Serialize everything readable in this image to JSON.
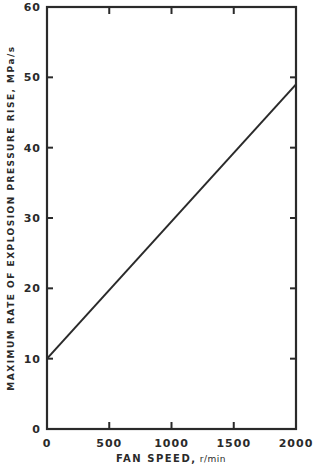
{
  "chart_data": {
    "type": "line",
    "title": "",
    "xlabel": "FAN SPEED, r/min",
    "ylabel": "MAXIMUM RATE OF EXPLOSION PRESSURE RISE, MPa/s",
    "xlim": [
      0,
      2000
    ],
    "ylim": [
      0,
      60
    ],
    "xticks": [
      0,
      500,
      1000,
      1500,
      2000
    ],
    "yticks": [
      0,
      10,
      20,
      30,
      40,
      50,
      60
    ],
    "grid": false,
    "legend": null,
    "series": [
      {
        "name": "Max rate of pressure rise",
        "x": [
          0,
          2000
        ],
        "y": [
          10,
          49
        ]
      }
    ]
  },
  "labels": {
    "xlabel_main": "FAN SPEED,",
    "xlabel_unit": " r/min",
    "ylabel": "MAXIMUM RATE OF EXPLOSION PRESSURE RISE, MPa/s"
  }
}
